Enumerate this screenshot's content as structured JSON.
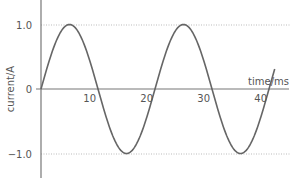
{
  "chart_data": {
    "type": "line",
    "title": "",
    "xlabel": "time/ms",
    "ylabel": "current/A",
    "xlim": [
      0,
      43
    ],
    "ylim": [
      -1.3,
      1.4
    ],
    "x_ticks": [
      10,
      20,
      30,
      40
    ],
    "x_tick_labels": [
      "10",
      "20",
      "30",
      "40"
    ],
    "y_ticks": [
      1.0,
      0,
      -1.0
    ],
    "y_tick_labels": [
      "1.0",
      "0",
      "−1.0"
    ],
    "reference_lines": [
      {
        "y": 1.0,
        "style": "dotted"
      },
      {
        "y": -1.0,
        "style": "dotted"
      }
    ],
    "grid": false,
    "legend": null,
    "series": [
      {
        "name": "current",
        "function": "sine",
        "amplitude": 1.0,
        "period_ms": 20,
        "x": [
          0,
          5,
          10,
          15,
          20,
          25,
          30,
          35,
          40
        ],
        "values": [
          0,
          1.0,
          0,
          -1.0,
          0,
          1.0,
          0,
          -1.0,
          0
        ]
      }
    ]
  },
  "labels": {
    "ylabel": "current/A",
    "xlabel": "time/ms",
    "y_pos": "1.0",
    "y_zero": "0",
    "y_neg": "−1.0",
    "x10": "10",
    "x20": "20",
    "x30": "30",
    "x40": "40"
  }
}
